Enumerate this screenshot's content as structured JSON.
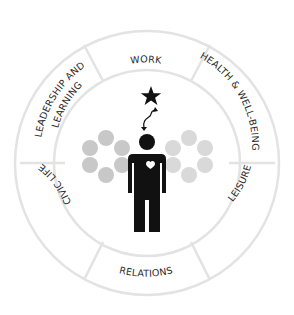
{
  "diagram": {
    "segments": [
      {
        "id": "work",
        "label": "WORK"
      },
      {
        "id": "health",
        "label": "HEALTH & WELL-BEING"
      },
      {
        "id": "leisure",
        "label": "LEISURE"
      },
      {
        "id": "relations",
        "label": "RELATIONS"
      },
      {
        "id": "civic",
        "label": "CIVIC LIFE"
      },
      {
        "id": "leadership",
        "label": "LEADERSHIP AND LEARNING",
        "lines": [
          "LEADERSHIP AND",
          "LEARNING"
        ]
      }
    ],
    "center": {
      "figure": "person-with-heart",
      "goal_icon": "star",
      "connector": "squiggly-arrow"
    },
    "colors": {
      "ring_stroke": "#e3e3e3",
      "figure": "#111111",
      "circles_left": "#c8c8c8",
      "circles_right": "#d9d9d9",
      "text": "#2a2a2a"
    }
  }
}
